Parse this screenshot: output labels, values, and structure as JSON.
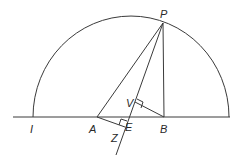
{
  "diagram": {
    "type": "geometric-construction",
    "points": {
      "P": {
        "label": "P",
        "x": 163,
        "y": 23
      },
      "I": {
        "label": "I",
        "x": 33,
        "y": 117
      },
      "A": {
        "label": "A",
        "x": 97,
        "y": 117
      },
      "E": {
        "label": "E",
        "x": 123,
        "y": 117
      },
      "B": {
        "label": "B",
        "x": 164,
        "y": 117
      },
      "V": {
        "label": "V",
        "x": 135,
        "y": 102
      },
      "Z": {
        "label": "Z",
        "x": 121,
        "y": 126
      }
    },
    "labels": {
      "P": "P",
      "I": "I",
      "A": "A",
      "E": "E",
      "B": "B",
      "V": "V",
      "Z": "Z"
    },
    "elements": [
      "semicircle on baseline",
      "baseline",
      "segment PA",
      "line PE extended beyond E",
      "segment PB",
      "segment VB perpendicular to PE",
      "segment AZ perpendicular to PE"
    ],
    "stroke_color": "#3a3a3a"
  }
}
